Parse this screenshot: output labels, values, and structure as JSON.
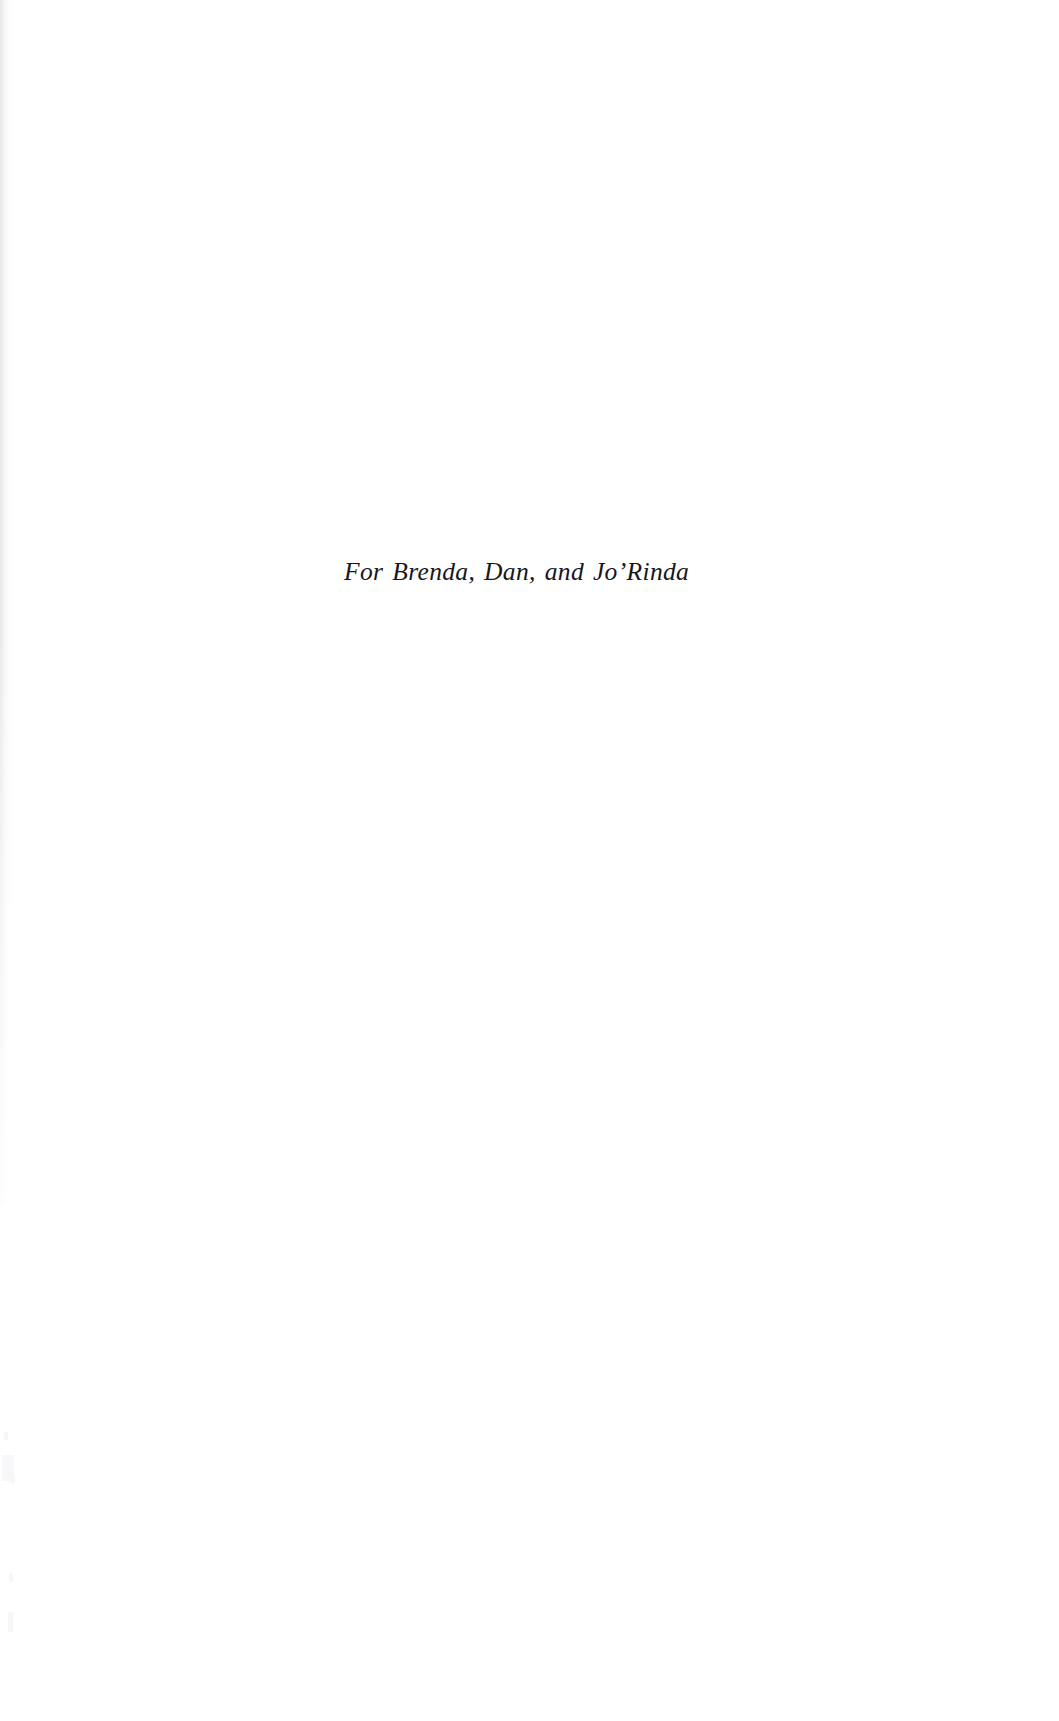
{
  "page": {
    "kind": "book-dedication-page",
    "background_color": "#ffffff",
    "width": 1059,
    "height": 1721
  },
  "dedication": {
    "text": "For Brenda, Dan, and Jo’Rinda",
    "text_color": "#17171c",
    "style": "italic-serif",
    "alignment": "centered-on-text-block"
  },
  "artifacts": {
    "left_edge_shadow_color": "#e4e4e6",
    "speckle_color": "#f6f6f8"
  }
}
